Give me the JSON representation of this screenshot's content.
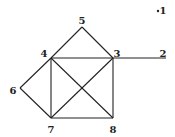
{
  "diagram": {
    "type": "graph",
    "nodes": [
      {
        "id": "1",
        "label": "1",
        "x": 158,
        "y": 11,
        "lx": 163,
        "ly": 11,
        "isolated": true
      },
      {
        "id": "2",
        "label": "2",
        "x": 166,
        "y": 58,
        "lx": 163,
        "ly": 54
      },
      {
        "id": "3",
        "label": "3",
        "x": 113,
        "y": 58,
        "lx": 117,
        "ly": 54
      },
      {
        "id": "4",
        "label": "4",
        "x": 51,
        "y": 58,
        "lx": 44,
        "ly": 54
      },
      {
        "id": "5",
        "label": "5",
        "x": 82,
        "y": 27,
        "lx": 82,
        "ly": 21
      },
      {
        "id": "6",
        "label": "6",
        "x": 20,
        "y": 88,
        "lx": 13,
        "ly": 91
      },
      {
        "id": "7",
        "label": "7",
        "x": 51,
        "y": 118,
        "lx": 51,
        "ly": 130
      },
      {
        "id": "8",
        "label": "8",
        "x": 113,
        "y": 118,
        "lx": 113,
        "ly": 130
      }
    ],
    "edges": [
      [
        "5",
        "4"
      ],
      [
        "5",
        "3"
      ],
      [
        "4",
        "3"
      ],
      [
        "3",
        "2"
      ],
      [
        "4",
        "6"
      ],
      [
        "6",
        "7"
      ],
      [
        "4",
        "7"
      ],
      [
        "3",
        "8"
      ],
      [
        "7",
        "8"
      ],
      [
        "4",
        "8"
      ],
      [
        "3",
        "7"
      ]
    ],
    "colors": {
      "stroke": "#222222",
      "background": "#ffffff"
    }
  }
}
